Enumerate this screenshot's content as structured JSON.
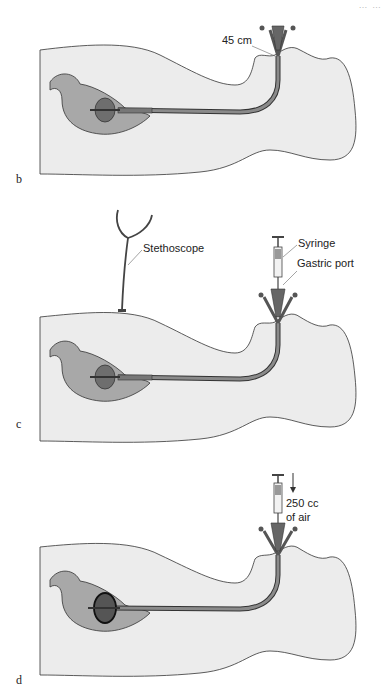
{
  "figure": {
    "corner_header": "… …",
    "panels": [
      {
        "letter": "b",
        "labels": {
          "length_marker": "45 cm"
        }
      },
      {
        "letter": "c",
        "labels": {
          "stethoscope": "Stethoscope",
          "syringe": "Syringe",
          "gastric_port": "Gastric port"
        }
      },
      {
        "letter": "d",
        "labels": {
          "air_volume_line1": "250 cc",
          "air_volume_line2": "of air"
        }
      }
    ],
    "colors": {
      "body_fill": "#ececec",
      "stomach_fill": "#a8a8a8",
      "balloon_fill": "#6e6e6e",
      "tube_fill": "#7a7a7a",
      "outline": "#333333"
    }
  }
}
